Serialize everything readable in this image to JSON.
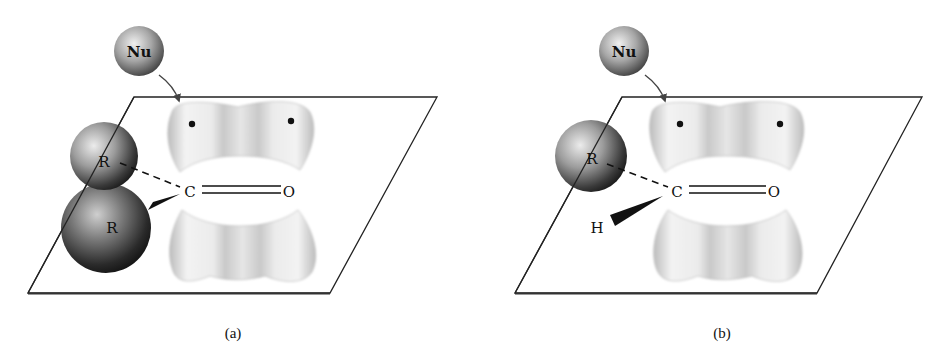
{
  "figure": {
    "panels": [
      {
        "id": "a",
        "caption": "(a)",
        "nucleophile_label": "Nu",
        "substituents": [
          {
            "label": "R",
            "type": "sphere",
            "position": "upper-left",
            "bond": "dashed"
          },
          {
            "label": "R",
            "type": "sphere",
            "position": "lower-left",
            "bond": "wedge"
          }
        ],
        "carbonyl": {
          "carbon_label": "C",
          "oxygen_label": "O",
          "bond": "double"
        },
        "lone_pair_dots": 2
      },
      {
        "id": "b",
        "caption": "(b)",
        "nucleophile_label": "Nu",
        "substituents": [
          {
            "label": "R",
            "type": "sphere",
            "position": "upper-left",
            "bond": "dashed"
          },
          {
            "label": "H",
            "type": "atom",
            "position": "lower-left",
            "bond": "wedge"
          }
        ],
        "carbonyl": {
          "carbon_label": "C",
          "oxygen_label": "O",
          "bond": "double"
        },
        "lone_pair_dots": 2
      }
    ],
    "colors": {
      "background": "#ffffff",
      "plane_line": "#222222",
      "orbital_light": "#f2f2f2",
      "orbital_dark": "#9a9a9a",
      "sphere_light": "#e0e0e0",
      "sphere_dark": "#222222"
    }
  }
}
